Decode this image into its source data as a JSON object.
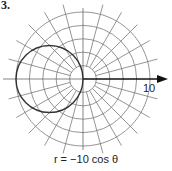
{
  "figure": {
    "problem_number": "3.",
    "caption": "r = −10 cos θ",
    "axis_tick_label": "10",
    "axis_end_label": "θ"
  },
  "chart_data": {
    "type": "polar",
    "title": "r = −10 cos θ",
    "equation": "r = -10 cos(theta)",
    "grid": {
      "rings": [
        2,
        4,
        6,
        8,
        10
      ],
      "spoke_step_degrees": 15,
      "rmax": 10
    },
    "curve": {
      "shape": "circle",
      "center_cartesian": [
        -5,
        0
      ],
      "radius": 5
    },
    "axis_labels": {
      "polar_axis_tick": "10"
    },
    "colors": {
      "grid": "#777777",
      "curve": "#333333",
      "axis": "#111111"
    }
  }
}
